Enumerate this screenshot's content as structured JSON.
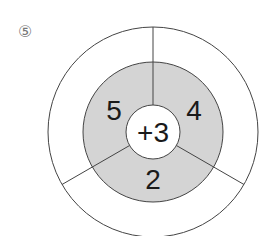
{
  "problem_number": "⑤",
  "diagram": {
    "center": [
      153,
      132
    ],
    "outer_radius": 105,
    "middle_radius": 70,
    "inner_radius": 27,
    "colors": {
      "ring_fill": "#d4d4d4",
      "outer_fill": "#ffffff",
      "inner_fill": "#ffffff",
      "stroke": "#444444"
    },
    "center_label": "+3",
    "segments": [
      {
        "position": "upper-left",
        "value": "5",
        "outer_answer": ""
      },
      {
        "position": "upper-right",
        "value": "4",
        "outer_answer": ""
      },
      {
        "position": "bottom",
        "value": "2",
        "outer_answer": ""
      }
    ]
  }
}
